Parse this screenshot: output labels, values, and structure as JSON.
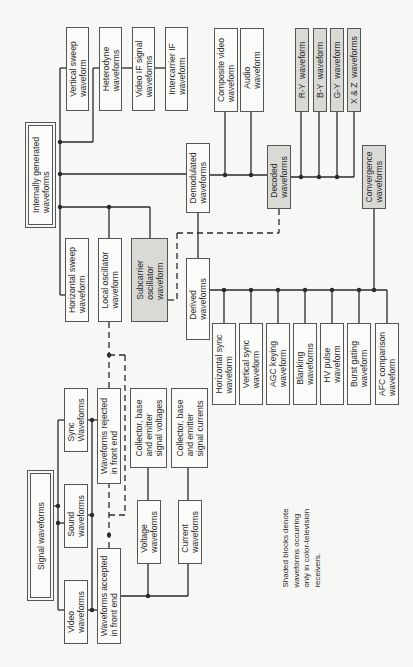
{
  "diagram": {
    "legend_note": "Shaded blocks denote\nwaveforms occurring\nonly in color-television\nreceivers.",
    "internally_generated": {
      "root": "Internally generated\nwaveforms",
      "top_branch": [
        "Vertical sweep\nwaveform",
        "Heterodyne\nwaveforms",
        "Video IF signal\nwaveforms",
        "Intercarrier IF\nwaveform"
      ],
      "bottom_branch": [
        "Horizontal sweep\nwaveform",
        "Local oscillator\nwaveform",
        "Subcarrier\noscillator\nwaveform"
      ],
      "demodulated": "Demodulated\nwaveforms",
      "demodulated_children": [
        "Composite video\nwaveform",
        "Audio\nwaveform"
      ],
      "decoded": "Decoded\nwaveforms",
      "decoded_children": [
        "R-Y  waveform",
        "B-Y  waveform",
        "G-Y  waveform",
        "X & Z  waveforms"
      ],
      "convergence": "Convergence\nwaveforms",
      "derived": "Derived\nwaveforms",
      "derived_children": [
        "Horizontal sync\nwaveform",
        "Vertical sync\nwaveform",
        "AGC keying\nwaveform",
        "Blanking\nwaveforms",
        "HV pulse\nwaveform",
        "Burst gating\nwaveform",
        "AFC comparison\nwaveform"
      ]
    },
    "signal": {
      "root": "Signal waveforms",
      "inputs": [
        "Sync\nWaveforms",
        "Sound\nwaveforms",
        "Video\nwaveforms"
      ],
      "rejected": "Waveforms rejected\nin front end",
      "accepted": "Waveforms accepted\nin front end",
      "collector_voltages": "Collector, base\nand emitter\nsignal voltages",
      "collector_currents": "Collector, base\nand emitter\nsignal currents",
      "voltage": "Voltage\nwaveforms",
      "current": "Current\nwaveforms"
    },
    "shaded_blocks": [
      "Subcarrier oscillator waveform",
      "Decoded waveforms",
      "R-Y waveform",
      "B-Y waveform",
      "G-Y waveform",
      "X & Z waveforms",
      "Convergence waveforms"
    ],
    "colors": {
      "line": "#2a2a2a",
      "shade": "#d9d9d6",
      "border": "#555555"
    }
  }
}
